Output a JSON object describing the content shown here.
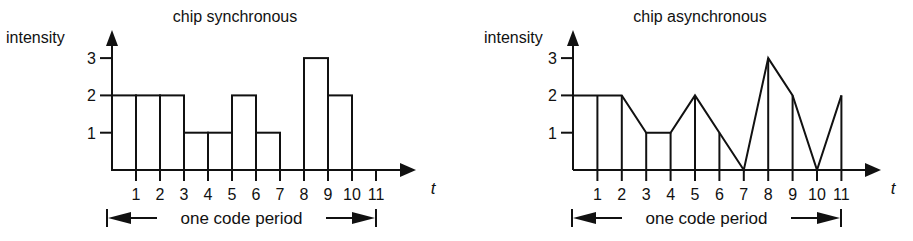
{
  "chart_data": [
    {
      "type": "bar",
      "title": "chip synchronous",
      "xlabel": "t",
      "ylabel": "intensity",
      "x_ticks": [
        "1",
        "2",
        "3",
        "4",
        "5",
        "6",
        "7",
        "8",
        "9",
        "10",
        "11"
      ],
      "y_ticks": [
        "1",
        "2",
        "3"
      ],
      "ylim": [
        0,
        3
      ],
      "grid": false,
      "description": "Step (rectangular) intensity per chip interval over one code period",
      "intervals": [
        {
          "from": 0,
          "to": 1,
          "value": 2
        },
        {
          "from": 1,
          "to": 2,
          "value": 2
        },
        {
          "from": 2,
          "to": 3,
          "value": 2
        },
        {
          "from": 3,
          "to": 4,
          "value": 1
        },
        {
          "from": 4,
          "to": 5,
          "value": 1
        },
        {
          "from": 5,
          "to": 6,
          "value": 2
        },
        {
          "from": 6,
          "to": 7,
          "value": 1
        },
        {
          "from": 7,
          "to": 8,
          "value": 0
        },
        {
          "from": 8,
          "to": 9,
          "value": 3
        },
        {
          "from": 9,
          "to": 10,
          "value": 2
        },
        {
          "from": 10,
          "to": 11,
          "value": 0
        }
      ],
      "categories": [
        "0-1",
        "1-2",
        "2-3",
        "3-4",
        "4-5",
        "5-6",
        "6-7",
        "7-8",
        "8-9",
        "9-10",
        "10-11"
      ],
      "values": [
        2,
        2,
        2,
        1,
        1,
        2,
        1,
        0,
        3,
        2,
        0
      ],
      "annotation": "one code period",
      "annotation_span": [
        0,
        11
      ]
    },
    {
      "type": "line",
      "title": "chip asynchronous",
      "xlabel": "t",
      "ylabel": "intensity",
      "x_ticks": [
        "1",
        "2",
        "3",
        "4",
        "5",
        "6",
        "7",
        "8",
        "9",
        "10",
        "11"
      ],
      "y_ticks": [
        "1",
        "2",
        "3"
      ],
      "ylim": [
        0,
        3
      ],
      "grid": false,
      "description": "Piecewise-linear intensity with vertical drop lines at each integer t",
      "x": [
        0,
        1,
        2,
        3,
        4,
        5,
        6,
        7,
        8,
        9,
        10,
        11
      ],
      "values": [
        2,
        2,
        2,
        1,
        1,
        2,
        1,
        0,
        3,
        2,
        0,
        2
      ],
      "annotation": "one code period",
      "annotation_span": [
        0,
        11
      ]
    }
  ],
  "charts": [
    {
      "title": "chip synchronous",
      "ylabel": "intensity",
      "xvar": "t",
      "period_label": "one code period",
      "y_ticks": [
        "1",
        "2",
        "3"
      ],
      "x_ticks": [
        "1",
        "2",
        "3",
        "4",
        "5",
        "6",
        "7",
        "8",
        "9",
        "10",
        "11"
      ]
    },
    {
      "title": "chip asynchronous",
      "ylabel": "intensity",
      "xvar": "t",
      "period_label": "one code period",
      "y_ticks": [
        "1",
        "2",
        "3"
      ],
      "x_ticks": [
        "1",
        "2",
        "3",
        "4",
        "5",
        "6",
        "7",
        "8",
        "9",
        "10",
        "11"
      ]
    }
  ],
  "colors": {
    "ink": "#111111",
    "background": "#ffffff"
  }
}
